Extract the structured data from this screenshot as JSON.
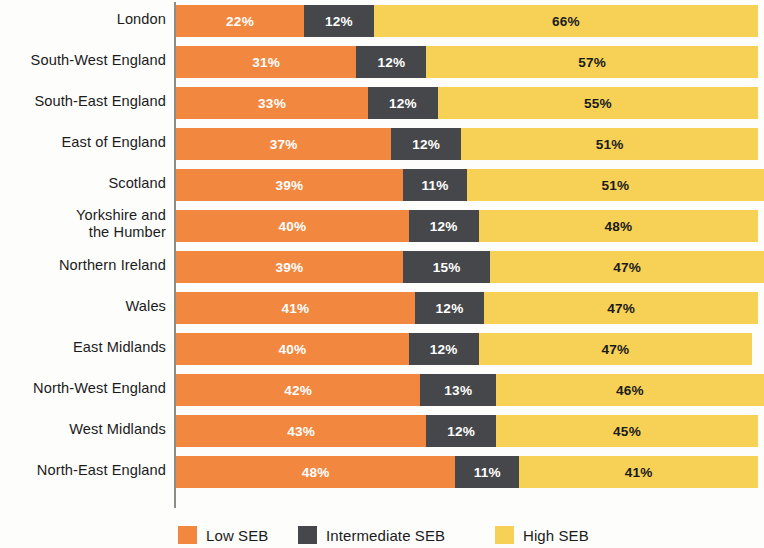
{
  "chart_data": {
    "type": "bar",
    "subtype": "stacked-horizontal-100pct",
    "title": "",
    "subtitle": "",
    "xlabel": "",
    "ylabel": "",
    "xlim": [
      0,
      100
    ],
    "grid": false,
    "legend_position": "bottom",
    "unit": "%",
    "categories": [
      "London",
      "South-West England",
      "South-East England",
      "East of England",
      "Scotland",
      "Yorkshire and\nthe Humber",
      "Northern Ireland",
      "Wales",
      "East Midlands",
      "North-West England",
      "West Midlands",
      "North-East England"
    ],
    "series": [
      {
        "name": "Low SEB",
        "color": "#f2883f",
        "values": [
          22,
          31,
          33,
          37,
          39,
          40,
          39,
          41,
          40,
          42,
          43,
          48
        ],
        "labels": [
          "22%",
          "31%",
          "33%",
          "37%",
          "39%",
          "40%",
          "39%",
          "41%",
          "40%",
          "42%",
          "43%",
          "48%"
        ]
      },
      {
        "name": "Intermediate SEB",
        "color": "#45474a",
        "values": [
          12,
          12,
          12,
          12,
          11,
          12,
          15,
          12,
          12,
          13,
          12,
          11
        ],
        "labels": [
          "12%",
          "12%",
          "12%",
          "12%",
          "11%",
          "12%",
          "15%",
          "12%",
          "12%",
          "13%",
          "12%",
          "11%"
        ]
      },
      {
        "name": "High SEB",
        "color": "#f7d155",
        "values": [
          66,
          57,
          55,
          51,
          51,
          48,
          47,
          47,
          47,
          46,
          45,
          41
        ],
        "labels": [
          "66%",
          "57%",
          "55%",
          "51%",
          "51%",
          "48%",
          "47%",
          "47%",
          "47%",
          "46%",
          "45%",
          "41%"
        ]
      }
    ]
  },
  "legend": {
    "items": [
      {
        "label": "Low SEB",
        "color": "#f2883f",
        "key": "low"
      },
      {
        "label": "Intermediate SEB",
        "color": "#45474a",
        "key": "mid"
      },
      {
        "label": "High SEB",
        "color": "#f7d155",
        "key": "high"
      }
    ]
  },
  "colors": {
    "low_seb": "#f2883f",
    "intermediate_seb": "#45474a",
    "high_seb": "#f7d155",
    "axis": "#8d8d86",
    "text": "#1b1b1b",
    "background": "#fdfdfb"
  }
}
